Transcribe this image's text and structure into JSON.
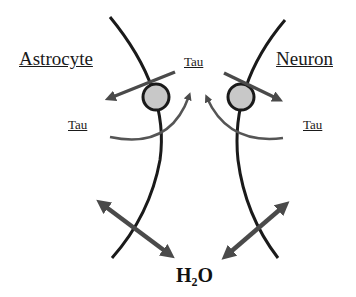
{
  "labels": {
    "astrocyte": "Astrocyte",
    "neuron": "Neuron",
    "tau_top": "Tau",
    "tau_left": "Tau",
    "tau_right": "Tau",
    "water_main": "H",
    "water_sub": "2",
    "water_tail": "O"
  },
  "colors": {
    "membrane": "#1a1a1a",
    "arrow": "#4a4a4a",
    "channel_fill": "#c8c8c8",
    "background": "#ffffff"
  },
  "icons": {
    "channel": "channel-circle-icon",
    "arrow": "arrow-icon",
    "double_arrow": "double-arrow-icon"
  }
}
